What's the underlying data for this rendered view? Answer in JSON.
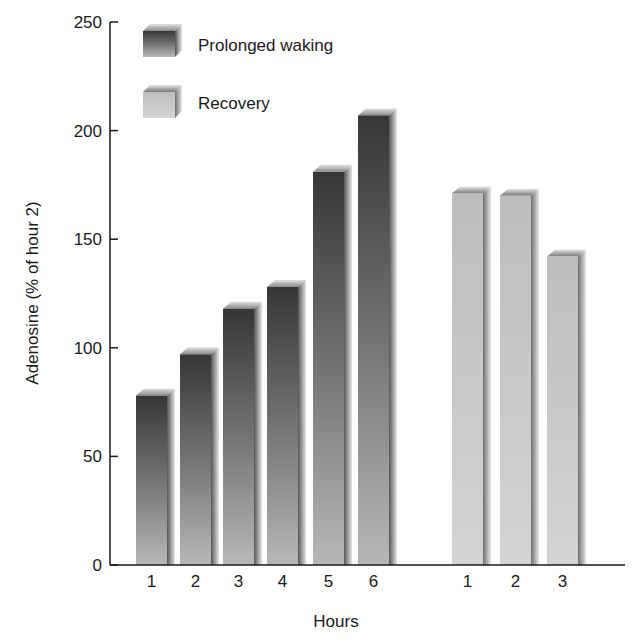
{
  "chart_data": {
    "type": "bar",
    "title": "",
    "xlabel": "Hours",
    "ylabel": "Adenosine (% of hour 2)",
    "ylim": [
      0,
      250
    ],
    "yticks": [
      0,
      50,
      100,
      150,
      200,
      250
    ],
    "grid": false,
    "legend_position": "top-left inside",
    "series": [
      {
        "name": "Prolonged waking",
        "color": "#3c3c3c",
        "categories": [
          "1",
          "2",
          "3",
          "4",
          "5",
          "6"
        ],
        "values": [
          78,
          97,
          118,
          128,
          181,
          207
        ]
      },
      {
        "name": "Recovery",
        "color": "#c4c4c4",
        "categories": [
          "1",
          "2",
          "3"
        ],
        "values": [
          171,
          170,
          142
        ]
      }
    ]
  },
  "legend": {
    "items": [
      {
        "label": "Prolonged waking"
      },
      {
        "label": "Recovery"
      }
    ]
  },
  "axes": {
    "y_title": "Adenosine (% of hour 2)",
    "x_title": "Hours",
    "y_ticks": [
      "0",
      "50",
      "100",
      "150",
      "200",
      "250"
    ]
  }
}
